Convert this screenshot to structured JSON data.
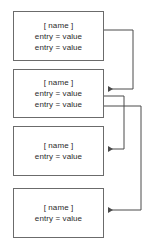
{
  "diagram": {
    "background_color": "#ffffff",
    "node_border_color": "#6b6b6b",
    "node_fill_color": "#ffffff",
    "edge_color": "#4a4a4a",
    "text_color": "#2b2b2b",
    "nodes": [
      {
        "id": "node-1",
        "title": "[ name ]",
        "entries": [
          "entry = value",
          "entry = value"
        ],
        "x": 13,
        "y": 11,
        "width": 91,
        "height": 50
      },
      {
        "id": "node-2",
        "title": "[ name ]",
        "entries": [
          "entry = value",
          "entry = value"
        ],
        "x": 13,
        "y": 69,
        "width": 91,
        "height": 49
      },
      {
        "id": "node-3",
        "title": "[ name ]",
        "entries": [
          "entry = value"
        ],
        "x": 13,
        "y": 126,
        "width": 91,
        "height": 50
      },
      {
        "id": "node-4",
        "title": "[ name ]",
        "entries": [
          "entry = value"
        ],
        "x": 13,
        "y": 188,
        "width": 91,
        "height": 50
      }
    ],
    "edges": [
      {
        "id": "edge-1-to-2",
        "from": "node-1",
        "to": "node-2",
        "arrow": "left",
        "path": "M 104 30 L 133 30 L 133 89 L 108 89"
      },
      {
        "id": "edge-2-to-3",
        "from": "node-2",
        "to": "node-3",
        "arrow": "left",
        "path": "M 104 96 L 124 96 L 124 149 L 108 149"
      },
      {
        "id": "edge-2-to-4",
        "from": "node-2",
        "to": "node-4",
        "arrow": "left",
        "path": "M 104 106 L 141 106 L 141 210 L 108 210"
      }
    ]
  }
}
